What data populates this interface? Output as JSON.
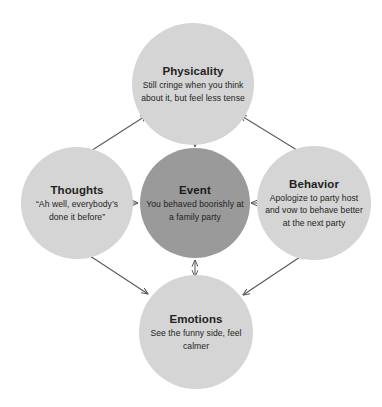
{
  "diagram": {
    "type": "cbt-hot-cross-bun",
    "background_color": "#ffffff",
    "arrow_color": "#58585a",
    "node_fill_outer": "#d5d5d5",
    "node_fill_center": "#9a9a9a",
    "text_color": "#231f20",
    "nodes": [
      {
        "id": "physicality",
        "title": "Physicality",
        "description": "Still cringe when you think about it, but feel less tense",
        "position": "top",
        "fill": "#d5d5d5"
      },
      {
        "id": "thoughts",
        "title": "Thoughts",
        "description": "“Ah well, everybody’s done it before”",
        "position": "left",
        "fill": "#d5d5d5"
      },
      {
        "id": "event",
        "title": "Event",
        "description": "You behaved boorishly at a family party",
        "position": "center",
        "fill": "#9a9a9a"
      },
      {
        "id": "behavior",
        "title": "Behavior",
        "description": "Apologize to party host and vow to behave better at the next party",
        "position": "right",
        "fill": "#d5d5d5"
      },
      {
        "id": "emotions",
        "title": "Emotions",
        "description": "See the funny side, feel calmer",
        "position": "bottom",
        "fill": "#d5d5d5"
      }
    ],
    "connections": [
      {
        "id": "event-physicality",
        "from": "event",
        "to": "physicality",
        "style": "double-headed-arrow",
        "orientation": "vertical"
      },
      {
        "id": "event-thoughts",
        "from": "event",
        "to": "thoughts",
        "style": "double-headed-arrow",
        "orientation": "horizontal"
      },
      {
        "id": "event-behavior",
        "from": "event",
        "to": "behavior",
        "style": "double-headed-arrow",
        "orientation": "horizontal"
      },
      {
        "id": "event-emotions",
        "from": "event",
        "to": "emotions",
        "style": "double-headed-arrow",
        "orientation": "vertical"
      },
      {
        "id": "thoughts-physicality",
        "from": "thoughts",
        "to": "physicality",
        "style": "double-headed-arrow",
        "orientation": "diagonal"
      },
      {
        "id": "physicality-behavior",
        "from": "physicality",
        "to": "behavior",
        "style": "double-headed-arrow",
        "orientation": "diagonal"
      },
      {
        "id": "thoughts-emotions",
        "from": "thoughts",
        "to": "emotions",
        "style": "double-headed-arrow",
        "orientation": "diagonal"
      },
      {
        "id": "emotions-behavior",
        "from": "emotions",
        "to": "behavior",
        "style": "double-headed-arrow",
        "orientation": "diagonal"
      }
    ]
  }
}
